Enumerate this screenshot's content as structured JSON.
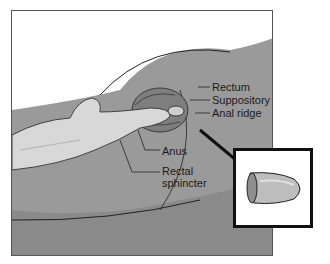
{
  "figure": {
    "labels": {
      "rectum": "Rectum",
      "suppository": "Suppository",
      "anal_ridge": "Anal ridge",
      "anus": "Anus",
      "rectal_sphincter_line1": "Rectal",
      "rectal_sphincter_line2": "sphincter"
    },
    "colors": {
      "skin_dark": "#8a8a8a",
      "skin_mid": "#a8a8a8",
      "skin_light": "#c4c4c4",
      "glove": "#d8d8d8",
      "outline": "#222222",
      "suppository": "#b5b5b5"
    }
  }
}
